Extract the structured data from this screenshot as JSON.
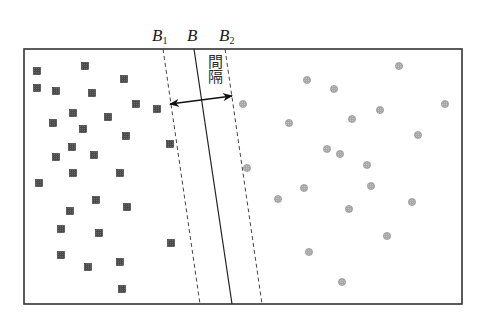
{
  "diagram": {
    "frame": {
      "x": 24,
      "y": 49,
      "width": 438,
      "height": 255,
      "stroke": "#333333"
    },
    "colors": {
      "square_fill": "#4a4a4a",
      "square_stroke": "#2e2e2e",
      "circle_fill": "#a8a8a8",
      "circle_stroke": "#8a8a8a",
      "line": "#222222",
      "dashed": "#444444"
    },
    "labels": {
      "b1_main": "B",
      "b1_sub": "1",
      "b_main": "B",
      "b2_main": "B",
      "b2_sub": "2",
      "margin_text": "間隔"
    },
    "lines": {
      "b1": {
        "x1": 163,
        "y1": 49,
        "x2": 200,
        "y2": 304,
        "style": "dashed"
      },
      "b": {
        "x1": 194,
        "y1": 49,
        "x2": 232,
        "y2": 304,
        "style": "solid"
      },
      "b2": {
        "x1": 225,
        "y1": 49,
        "x2": 262,
        "y2": 304,
        "style": "dashed"
      }
    },
    "arrow": {
      "x1": 170,
      "y1": 104,
      "x2": 232,
      "y2": 96
    },
    "square_size": 7,
    "circle_radius": 3.6,
    "squares": [
      [
        37,
        71
      ],
      [
        85,
        66
      ],
      [
        124,
        79
      ],
      [
        37,
        88
      ],
      [
        56,
        91
      ],
      [
        92,
        93
      ],
      [
        136,
        104
      ],
      [
        157,
        109
      ],
      [
        73,
        113
      ],
      [
        108,
        117
      ],
      [
        53,
        123
      ],
      [
        83,
        129
      ],
      [
        126,
        136
      ],
      [
        170,
        144
      ],
      [
        72,
        147
      ],
      [
        56,
        157
      ],
      [
        94,
        155
      ],
      [
        73,
        173
      ],
      [
        120,
        173
      ],
      [
        39,
        183
      ],
      [
        96,
        200
      ],
      [
        127,
        207
      ],
      [
        70,
        211
      ],
      [
        61,
        229
      ],
      [
        99,
        233
      ],
      [
        171,
        243
      ],
      [
        61,
        255
      ],
      [
        88,
        267
      ],
      [
        120,
        262
      ],
      [
        122,
        289
      ]
    ],
    "circles": [
      [
        399,
        66
      ],
      [
        307,
        80
      ],
      [
        334,
        89
      ],
      [
        243,
        104
      ],
      [
        445,
        104
      ],
      [
        380,
        110
      ],
      [
        352,
        119
      ],
      [
        289,
        123
      ],
      [
        418,
        135
      ],
      [
        327,
        149
      ],
      [
        340,
        154
      ],
      [
        367,
        165
      ],
      [
        247,
        168
      ],
      [
        304,
        188
      ],
      [
        371,
        186
      ],
      [
        278,
        199
      ],
      [
        412,
        202
      ],
      [
        349,
        209
      ],
      [
        387,
        236
      ],
      [
        309,
        252
      ],
      [
        342,
        282
      ]
    ]
  }
}
